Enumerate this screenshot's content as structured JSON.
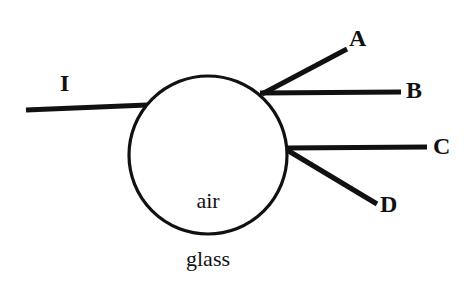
{
  "figure": {
    "background_color": "#ffffff",
    "ink_color": "#111111",
    "width": 476,
    "height": 297
  },
  "media": {
    "inner_label": "air",
    "outer_label": "glass"
  },
  "circle": {
    "name": "air-bubble-boundary",
    "cx": 208,
    "cy": 155,
    "r": 79
  },
  "rays": [
    {
      "id": "I",
      "label": "I",
      "role": "incident-ray",
      "x1": 26,
      "y1": 110,
      "x2": 147,
      "y2": 105,
      "width": 5
    },
    {
      "id": "A",
      "label": "A",
      "role": "outgoing-ray-upper",
      "x1": 262,
      "y1": 94,
      "x2": 347,
      "y2": 49,
      "width": 5
    },
    {
      "id": "B",
      "label": "B",
      "role": "outgoing-ray-horizontal-upper",
      "x1": 262,
      "y1": 93,
      "x2": 401,
      "y2": 92,
      "width": 5
    },
    {
      "id": "C",
      "label": "C",
      "role": "outgoing-ray-horizontal-lower",
      "x1": 287,
      "y1": 148,
      "x2": 427,
      "y2": 147,
      "width": 5
    },
    {
      "id": "D",
      "label": "D",
      "role": "outgoing-ray-lower",
      "x1": 287,
      "y1": 150,
      "x2": 377,
      "y2": 204,
      "width": 5
    }
  ],
  "labels": {
    "I": "I",
    "A": "A",
    "B": "B",
    "C": "C",
    "D": "D"
  }
}
